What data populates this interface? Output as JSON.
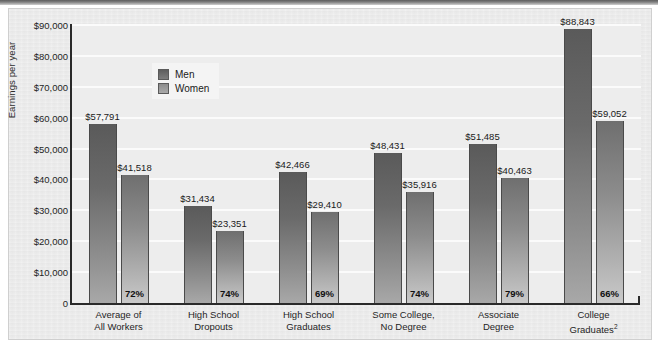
{
  "chart_data": {
    "type": "bar",
    "title": "",
    "xlabel": "",
    "ylabel": "Earnings per year",
    "ylim": [
      0,
      90000
    ],
    "grid": true,
    "legend_position": "top-center-left",
    "categories": [
      "Average of\nAll Workers",
      "High School\nDropouts",
      "High School\nGraduates",
      "Some College,\nNo Degree",
      "Associate\nDegree",
      "College\nGraduates"
    ],
    "category_lines": [
      [
        "Average of",
        "All Workers"
      ],
      [
        "High School",
        "Dropouts"
      ],
      [
        "High School",
        "Graduates"
      ],
      [
        "Some College,",
        "No Degree"
      ],
      [
        "Associate",
        "Degree"
      ],
      [
        "College",
        "Graduates"
      ]
    ],
    "category_footnotes": [
      "",
      "",
      "",
      "",
      "",
      "2"
    ],
    "series": [
      {
        "name": "Men",
        "values": [
          57791,
          31434,
          42466,
          48431,
          51485,
          88843
        ],
        "labels": [
          "$57,791",
          "$31,434",
          "$42,466",
          "$48,431",
          "$51,485",
          "$88,843"
        ],
        "color": "#6a6a6a"
      },
      {
        "name": "Women",
        "values": [
          41518,
          23351,
          29410,
          35916,
          40463,
          59052
        ],
        "labels": [
          "$41,518",
          "$23,351",
          "$29,410",
          "$35,916",
          "$40,463",
          "$59,052"
        ],
        "color": "#a0a0a0"
      }
    ],
    "annotations": {
      "women_pct_of_men": [
        "72%",
        "74%",
        "69%",
        "74%",
        "79%",
        "66%"
      ]
    },
    "ytick_values": [
      90000,
      80000,
      70000,
      60000,
      50000,
      40000,
      30000,
      20000,
      10000,
      0
    ],
    "ytick_labels": [
      "$90,000",
      "$80,000",
      "$70,000",
      "$60,000",
      "$50,000",
      "$40,000",
      "$30,000",
      "$20,000",
      "$10,000",
      "0"
    ]
  },
  "legend": {
    "items": [
      {
        "label": "Men",
        "swatch": "men"
      },
      {
        "label": "Women",
        "swatch": "women"
      }
    ]
  },
  "colors": {
    "card_background": "#ebebeb",
    "plot_background": "#ededed",
    "gridline": "#fbfbfb",
    "axis": "#2a2a2a",
    "men_bar": "#6a6a6a",
    "women_bar": "#a0a0a0",
    "text": "#1f1f1f"
  }
}
